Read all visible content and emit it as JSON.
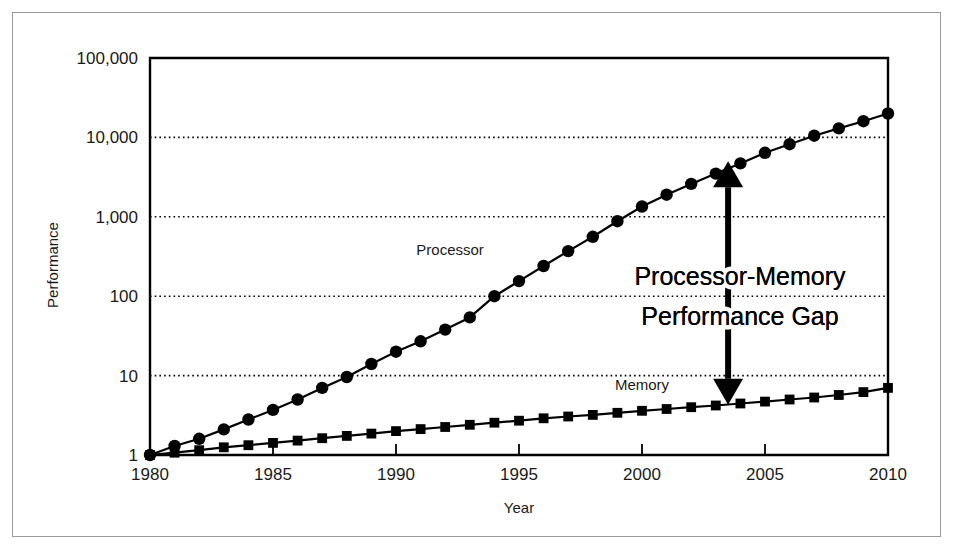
{
  "figure": {
    "title": "Processor-Memory Performance Gap",
    "background_color": "#ffffff",
    "border_color": "#9a9a9a",
    "ink_color": "#000000"
  },
  "annotation": {
    "line1": "Processor-Memory",
    "line2": "Performance Gap",
    "arrow": "double-headed-vertical-arrow",
    "arrow_year": 2003.5,
    "arrow_top_value": 5000,
    "arrow_bottom_value": 4.3
  },
  "chart_data": {
    "type": "line",
    "title": "",
    "xlabel": "Year",
    "ylabel": "Performance",
    "xlim": [
      1980,
      2010
    ],
    "ylim": [
      1,
      100000
    ],
    "yscale": "log",
    "grid": true,
    "grid_axis": "y",
    "legend": "inline-labels",
    "xticks": [
      1980,
      1985,
      1990,
      1995,
      2000,
      2005,
      2010
    ],
    "xticklabels": [
      "1980",
      "1985",
      "1990",
      "1995",
      "2000",
      "2005",
      "2010"
    ],
    "yticks": [
      1,
      10,
      100,
      1000,
      10000,
      100000
    ],
    "yticklabels": [
      "1",
      "10",
      "100",
      "1,000",
      "10,000",
      "100,000"
    ],
    "x": [
      1980,
      1981,
      1982,
      1983,
      1984,
      1985,
      1986,
      1987,
      1988,
      1989,
      1990,
      1991,
      1992,
      1993,
      1994,
      1995,
      1996,
      1997,
      1998,
      1999,
      2000,
      2001,
      2002,
      2003,
      2004,
      2005,
      2006,
      2007,
      2008,
      2009,
      2010
    ],
    "series": [
      {
        "name": "Processor",
        "marker": "circle",
        "label_x": 1992.2,
        "label_y": 330,
        "values": [
          1.0,
          1.3,
          1.6,
          2.1,
          2.8,
          3.7,
          5.0,
          7.0,
          9.6,
          14,
          20,
          27,
          38,
          54,
          100,
          155,
          240,
          370,
          560,
          880,
          1350,
          1900,
          2600,
          3500,
          4700,
          6400,
          8200,
          10500,
          13000,
          16000,
          20000
        ]
      },
      {
        "name": "Memory",
        "marker": "square",
        "label_x": 2000.0,
        "label_y": 6.6,
        "values": [
          1.0,
          1.07,
          1.15,
          1.25,
          1.33,
          1.42,
          1.52,
          1.63,
          1.74,
          1.86,
          2.0,
          2.12,
          2.25,
          2.4,
          2.55,
          2.7,
          2.9,
          3.05,
          3.2,
          3.4,
          3.6,
          3.8,
          4.0,
          4.2,
          4.45,
          4.7,
          5.0,
          5.3,
          5.7,
          6.2,
          7.0
        ]
      }
    ]
  }
}
